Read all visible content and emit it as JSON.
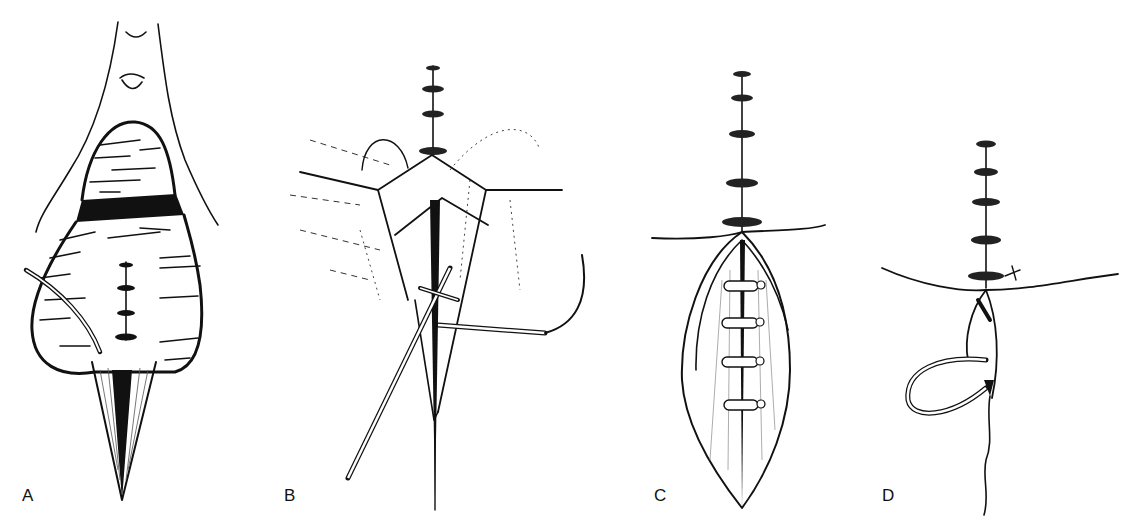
{
  "figure": {
    "panels": [
      {
        "id": "A",
        "label": "A",
        "description": "bladder with upper anastomosis sutures and tube"
      },
      {
        "id": "B",
        "label": "B",
        "description": "incision with flaps, sutures and curved needle"
      },
      {
        "id": "C",
        "label": "C",
        "description": "closed incision with interrupted tied sutures"
      },
      {
        "id": "D",
        "label": "D",
        "description": "suture line with looped stent/thread"
      }
    ],
    "colors": {
      "ink": "#111111",
      "background": "#ffffff"
    }
  }
}
